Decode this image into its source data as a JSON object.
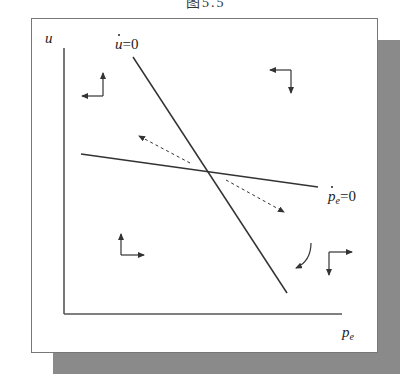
{
  "title": "图5.5",
  "diagram": {
    "axes": {
      "y_label": "u",
      "x_label_base": "p",
      "x_label_sub": "e"
    },
    "curves": [
      {
        "id": "u-dot-zero",
        "label_var": "u",
        "label_rest": "=0",
        "description": "steep downward-sloping locus where u̇ = 0"
      },
      {
        "id": "pe-dot-zero",
        "label_var": "p",
        "label_sub": "e",
        "label_rest": "=0",
        "description": "flat downward-sloping locus where ṗe = 0"
      }
    ],
    "direction_arrows": [
      {
        "region": "upper-left",
        "directions": [
          "up",
          "left"
        ]
      },
      {
        "region": "upper-right",
        "directions": [
          "left",
          "down"
        ]
      },
      {
        "region": "lower-left",
        "directions": [
          "up",
          "right"
        ]
      },
      {
        "region": "lower-right",
        "directions": [
          "right",
          "down"
        ]
      }
    ],
    "saddle_path_arrows": [
      {
        "style": "dashed",
        "direction": "away from equilibrium, up-left"
      },
      {
        "style": "dashed",
        "direction": "away from equilibrium, down-right"
      }
    ],
    "curved_arrow": {
      "region": "lower-right",
      "direction": "clockwise down-left"
    },
    "colors": {
      "line": "#333333",
      "shadow": "#8a8a8a",
      "panel_border": "#777777",
      "background": "#ffffff"
    }
  }
}
